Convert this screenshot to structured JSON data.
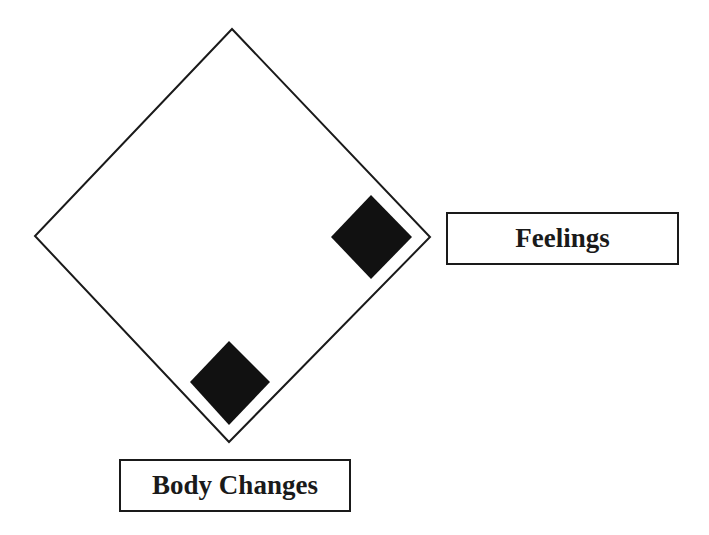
{
  "diagram": {
    "outer_diamond": {
      "points": [
        [
          232,
          29
        ],
        [
          430,
          237
        ],
        [
          229,
          442
        ],
        [
          35,
          236
        ]
      ],
      "stroke": "#1a1a1a"
    },
    "markers": [
      {
        "name": "feelings-marker",
        "points": [
          [
            371,
            195
          ],
          [
            412,
            237
          ],
          [
            371,
            279
          ],
          [
            331,
            237
          ]
        ],
        "fill": "#111111"
      },
      {
        "name": "body-changes-marker",
        "points": [
          [
            229,
            341
          ],
          [
            270,
            382
          ],
          [
            229,
            425
          ],
          [
            190,
            382
          ]
        ],
        "fill": "#111111"
      }
    ],
    "labels": {
      "feelings": "Feelings",
      "body_changes": "Body Changes"
    }
  }
}
